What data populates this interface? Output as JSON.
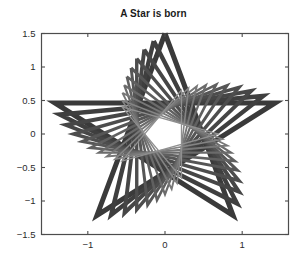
{
  "figure": {
    "background_color": "#ffffff",
    "width": 307,
    "height": 260
  },
  "chart_data": {
    "type": "line",
    "title": "A Star is born",
    "xlabel": "",
    "ylabel": "",
    "xlim": [
      -1.6,
      1.6
    ],
    "ylim": [
      -1.5,
      1.5
    ],
    "xticks": [
      -1,
      0,
      1
    ],
    "xticklabels": [
      "−1",
      "0",
      "1"
    ],
    "yticks": [
      -1.5,
      -1,
      -0.5,
      0,
      0.5,
      1,
      1.5
    ],
    "yticklabels": [
      "−1.5",
      "−1",
      "−0.5",
      "0",
      "0.5",
      "1",
      "1.5"
    ],
    "grid": false,
    "legend": null,
    "box": true,
    "axis_color": "#4d4d4d",
    "star": {
      "points": 5,
      "step": 2,
      "outer_radius_base": 1.5,
      "base_vertices_x": [
        0.0,
        0.8817,
        -1.4266,
        1.4266,
        -0.8817
      ],
      "base_vertices_y": [
        1.5,
        -0.4635,
        0.4635,
        0.4635,
        -0.4635
      ]
    },
    "series": [
      {
        "name": "star-1",
        "scale": 1.0,
        "rotation_deg": 0,
        "line_width": 5.0,
        "color": "#3a3a3a"
      },
      {
        "name": "star-2",
        "scale": 0.93,
        "rotation_deg": 6,
        "line_width": 4.4,
        "color": "#3f3f3f"
      },
      {
        "name": "star-3",
        "scale": 0.86,
        "rotation_deg": 12,
        "line_width": 3.9,
        "color": "#464646"
      },
      {
        "name": "star-4",
        "scale": 0.79,
        "rotation_deg": 18,
        "line_width": 3.4,
        "color": "#4d4d4d"
      },
      {
        "name": "star-5",
        "scale": 0.72,
        "rotation_deg": 24,
        "line_width": 3.0,
        "color": "#565656"
      },
      {
        "name": "star-6",
        "scale": 0.66,
        "rotation_deg": 30,
        "line_width": 2.6,
        "color": "#606060"
      },
      {
        "name": "star-7",
        "scale": 0.6,
        "rotation_deg": 36,
        "line_width": 2.2,
        "color": "#6b6b6b"
      },
      {
        "name": "star-8",
        "scale": 0.55,
        "rotation_deg": 42,
        "line_width": 1.9,
        "color": "#777777"
      },
      {
        "name": "star-9",
        "scale": 0.5,
        "rotation_deg": 48,
        "line_width": 1.6,
        "color": "#848484"
      },
      {
        "name": "star-10",
        "scale": 0.46,
        "rotation_deg": 54,
        "line_width": 1.3,
        "color": "#909090"
      }
    ]
  }
}
